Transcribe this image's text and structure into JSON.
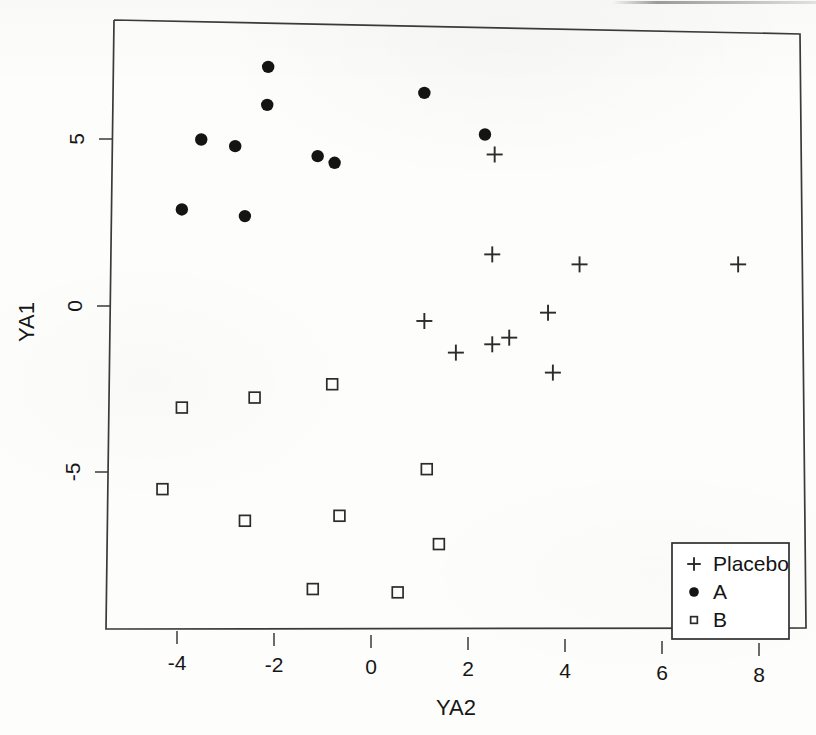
{
  "chart_data": {
    "type": "scatter",
    "title": "",
    "xlabel": "YA2",
    "ylabel": "YA1",
    "xlim": [
      -5.0,
      8.85
    ],
    "ylim": [
      -9.3,
      8.65
    ],
    "xticks": [
      -4,
      -2,
      0,
      2,
      4,
      6,
      8
    ],
    "xtick_labels": [
      "-4",
      "-2",
      "0",
      "2",
      "4",
      "6",
      "8"
    ],
    "yticks": [
      5,
      0,
      -5
    ],
    "ytick_labels": [
      "5",
      "0",
      "-5"
    ],
    "grid": false,
    "legend_position": "bottom-right",
    "series": [
      {
        "name": "Placebo",
        "marker": "plus",
        "color": "#2b2b2b",
        "points": [
          {
            "x": 2.55,
            "y": 4.55
          },
          {
            "x": 2.5,
            "y": 1.55
          },
          {
            "x": 4.3,
            "y": 1.25
          },
          {
            "x": 7.57,
            "y": 1.25
          },
          {
            "x": 3.65,
            "y": -0.2
          },
          {
            "x": 1.1,
            "y": -0.45
          },
          {
            "x": 2.5,
            "y": -1.15
          },
          {
            "x": 2.85,
            "y": -0.95
          },
          {
            "x": 1.75,
            "y": -1.4
          },
          {
            "x": 3.75,
            "y": -2.0
          }
        ]
      },
      {
        "name": "A",
        "marker": "filled-circle",
        "color": "#141414",
        "points": [
          {
            "x": -2.12,
            "y": 7.18
          },
          {
            "x": -2.14,
            "y": 6.04
          },
          {
            "x": -3.5,
            "y": 5.0
          },
          {
            "x": -2.8,
            "y": 4.8
          },
          {
            "x": 1.1,
            "y": 6.4
          },
          {
            "x": -1.1,
            "y": 4.5
          },
          {
            "x": -0.75,
            "y": 4.3
          },
          {
            "x": -3.9,
            "y": 2.9
          },
          {
            "x": -2.6,
            "y": 2.7
          },
          {
            "x": 2.35,
            "y": 5.15
          }
        ]
      },
      {
        "name": "B",
        "marker": "open-square",
        "color": "#2b2b2b",
        "points": [
          {
            "x": -3.9,
            "y": -3.05
          },
          {
            "x": -2.4,
            "y": -2.75
          },
          {
            "x": -0.8,
            "y": -2.35
          },
          {
            "x": -4.3,
            "y": -5.5
          },
          {
            "x": 1.15,
            "y": -4.9
          },
          {
            "x": -2.6,
            "y": -6.45
          },
          {
            "x": -0.65,
            "y": -6.3
          },
          {
            "x": 1.4,
            "y": -7.15
          },
          {
            "x": -1.2,
            "y": -8.5
          },
          {
            "x": 0.55,
            "y": -8.6
          }
        ]
      }
    ],
    "legend": [
      {
        "label": "Placebo",
        "marker": "plus"
      },
      {
        "label": "A",
        "marker": "filled-circle"
      },
      {
        "label": "B",
        "marker": "open-square"
      }
    ]
  }
}
